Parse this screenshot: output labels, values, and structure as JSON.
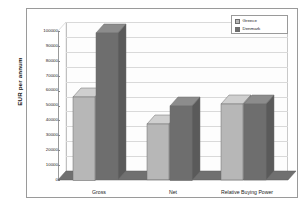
{
  "chart_data": {
    "type": "bar",
    "title": "",
    "subtitle": "",
    "xlabel": "",
    "ylabel": "EUR per annum",
    "categories": [
      "Gross",
      "Net",
      "Relative Buying Power"
    ],
    "series": [
      {
        "name": "Greece",
        "color": "#b7b7b7",
        "values": [
          56000,
          37500,
          51000
        ]
      },
      {
        "name": "Denmark",
        "color": "#6e6e6e",
        "values": [
          98500,
          50000,
          51000
        ]
      }
    ],
    "ylim": [
      0,
      100000
    ],
    "ytick_values": [
      0,
      10000,
      20000,
      30000,
      40000,
      50000,
      60000,
      70000,
      80000,
      90000,
      100000
    ],
    "ytick_labels": [
      "0",
      "10000",
      "20000",
      "30000",
      "40000",
      "50000",
      "60000",
      "70000",
      "80000",
      "90000",
      "100000"
    ],
    "grid": true,
    "grid_axis": "y",
    "legend_position": "top-right",
    "three_d": true
  },
  "legend": {
    "entries": [
      {
        "label": "Greece",
        "swatch": "#b7b7b7"
      },
      {
        "label": "Denmark",
        "swatch": "#6e6e6e"
      }
    ]
  },
  "colors": {
    "greece_front": "#b7b7b7",
    "greece_top": "#cfcfcf",
    "greece_side": "#9d9d9d",
    "denmark_front": "#6e6e6e",
    "denmark_top": "#8c8c8c",
    "denmark_side": "#5a5a5a",
    "floor": "#707070",
    "grid": "#d9d9d9",
    "frame": "#9a9a9a",
    "plot_bg": "#ffffff"
  }
}
